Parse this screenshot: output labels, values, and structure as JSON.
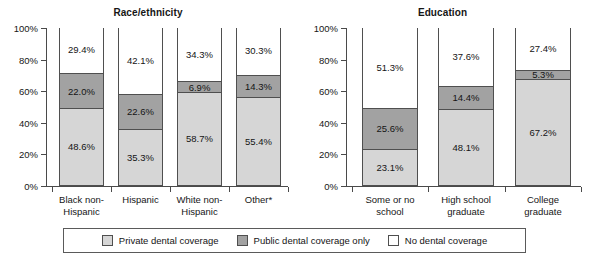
{
  "chart_data": [
    {
      "type": "bar",
      "title": "Race/ethnicity",
      "xlabel": "",
      "ylabel": "",
      "ylim": [
        0,
        100
      ],
      "grid": false,
      "stacked": true,
      "stack_total": 100,
      "legend_position": "bottom",
      "ytick_labels": [
        "100%",
        "80%",
        "60%",
        "40%",
        "20%",
        "0%"
      ],
      "ytick_values": [
        100,
        80,
        60,
        40,
        20,
        0
      ],
      "categories": [
        "Black non-Hispanic",
        "Hispanic",
        "White non-Hispanic",
        "Other*"
      ],
      "category_lines": [
        [
          "Black non-",
          "Hispanic"
        ],
        [
          "Hispanic"
        ],
        [
          "White non-",
          "Hispanic"
        ],
        [
          "Other*"
        ]
      ],
      "series": [
        {
          "name": "Private dental coverage",
          "color": "#d6d6d6",
          "values": [
            48.6,
            35.3,
            58.7,
            55.4
          ],
          "labels": [
            "48.6%",
            "35.3%",
            "58.7%",
            "55.4%"
          ]
        },
        {
          "name": "Public dental coverage only",
          "color": "#a2a2a2",
          "values": [
            22.0,
            22.6,
            6.9,
            14.3
          ],
          "labels": [
            "22.0%",
            "22.6%",
            "6.9%",
            "14.3%"
          ]
        },
        {
          "name": "No dental coverage",
          "color": "#ffffff",
          "values": [
            29.4,
            42.1,
            34.3,
            30.3
          ],
          "labels": [
            "29.4%",
            "42.1%",
            "34.3%",
            "30.3%"
          ]
        }
      ]
    },
    {
      "type": "bar",
      "title": "Education",
      "xlabel": "",
      "ylabel": "",
      "ylim": [
        0,
        100
      ],
      "grid": false,
      "stacked": true,
      "stack_total": 100,
      "legend_position": "bottom",
      "ytick_labels": [
        "100%",
        "80%",
        "60%",
        "40%",
        "20%",
        "0%"
      ],
      "ytick_values": [
        100,
        80,
        60,
        40,
        20,
        0
      ],
      "categories": [
        "Some or no school",
        "High school graduate",
        "College graduate"
      ],
      "category_lines": [
        [
          "Some or no",
          "school"
        ],
        [
          "High school",
          "graduate"
        ],
        [
          "College",
          "graduate"
        ]
      ],
      "series": [
        {
          "name": "Private dental coverage",
          "color": "#d6d6d6",
          "values": [
            23.1,
            48.1,
            67.2
          ],
          "labels": [
            "23.1%",
            "48.1%",
            "67.2%"
          ]
        },
        {
          "name": "Public dental coverage only",
          "color": "#a2a2a2",
          "values": [
            25.6,
            14.4,
            5.3
          ],
          "labels": [
            "25.6%",
            "14.4%",
            "5.3%"
          ]
        },
        {
          "name": "No dental coverage",
          "color": "#ffffff",
          "values": [
            51.3,
            37.6,
            27.4
          ],
          "labels": [
            "51.3%",
            "37.6%",
            "27.4%"
          ]
        }
      ]
    }
  ],
  "legend": {
    "items": [
      {
        "label": "Private dental coverage",
        "color": "#d6d6d6"
      },
      {
        "label": "Public dental coverage only",
        "color": "#a2a2a2"
      },
      {
        "label": "No dental coverage",
        "color": "#ffffff"
      }
    ]
  }
}
